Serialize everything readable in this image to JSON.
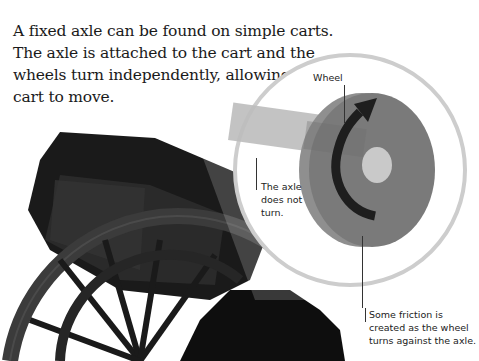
{
  "intro": {
    "text": "A fixed axle can be found on simple carts. The axle is attached to the cart and the wheels turn independently, allowing the cart to move."
  },
  "diagram": {
    "labels": {
      "wheel": "Wheel",
      "axle_line1": "The axle",
      "axle_line2": "does not",
      "axle_line3": "turn.",
      "friction_line1": "Some friction is",
      "friction_line2": "created as the wheel",
      "friction_line3": "turns against the axle."
    },
    "icons": [
      "rotation-arrow-icon"
    ],
    "colors": {
      "wheel_face": "#7a7a7a",
      "wheel_rim": "#8e8e8e",
      "axle_hub": "#c8c8c8",
      "axle_beam": "#bdbdbd",
      "magnifier_ring": "#cfcfcf",
      "cart": "#1c1c1c",
      "arrow": "#1e1e1e"
    }
  }
}
